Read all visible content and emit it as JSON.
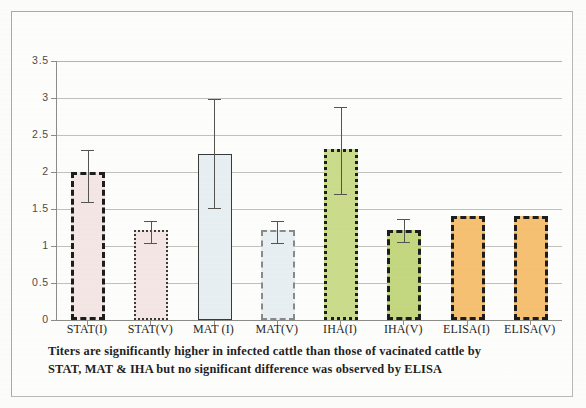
{
  "document": {
    "kind": "scanned-figure",
    "caption_line_1": "Titers are significantly higher in infected cattle than those of vacinated cattle by",
    "caption_line_2": "STAT, MAT & IHA but no significant difference was observed by ELISA"
  },
  "chart_data": {
    "type": "bar",
    "title": "",
    "xlabel": "",
    "ylabel": "",
    "ylim": [
      0,
      3.5
    ],
    "ytick_values": [
      0,
      0.5,
      1,
      1.5,
      2,
      2.5,
      3,
      3.5
    ],
    "ytick_labels": [
      "0",
      "0.5",
      "1",
      "1.5",
      "2",
      "2.5",
      "3",
      "3.5"
    ],
    "grid": true,
    "legend": "none",
    "categories": [
      "STAT(I)",
      "STAT(V)",
      "MAT (I)",
      "MAT(V)",
      "IHA(I)",
      "IHA(V)",
      "ELISA(I)",
      "ELISA(V)"
    ],
    "values": [
      2.0,
      1.21,
      2.25,
      2.31,
      1.21,
      1.21,
      1.4,
      1.4
    ],
    "bars": [
      {
        "label": "STAT(I)",
        "value": 2.0,
        "err_low": 1.6,
        "err_high": 2.3,
        "color": "#f4e7e6",
        "border_style": "dashed",
        "border_color": "#1d1d1d",
        "has_error_bar": true
      },
      {
        "label": "STAT(V)",
        "value": 1.21,
        "err_low": 1.04,
        "err_high": 1.34,
        "color": "#f4e7e6",
        "border_style": "dotted",
        "border_color": "#3a3a3a",
        "has_error_bar": true
      },
      {
        "label": "MAT (I)",
        "value": 2.25,
        "err_low": 1.51,
        "err_high": 2.98,
        "color": "#e9f0f3",
        "border_style": "solid",
        "border_color": "#3a3a3a",
        "has_error_bar": true
      },
      {
        "label": "MAT(V)",
        "value": 1.21,
        "err_low": 1.04,
        "err_high": 1.34,
        "color": "#e9f0f3",
        "border_style": "dashed",
        "border_color": "#8a8a8a",
        "has_error_bar": true
      },
      {
        "label": "IHA(I)",
        "value": 2.31,
        "err_low": 1.7,
        "err_high": 2.88,
        "color": "#cbdd8c",
        "border_style": "dotted",
        "border_color": "#1d1d1d",
        "has_error_bar": true
      },
      {
        "label": "IHA(V)",
        "value": 1.21,
        "err_low": 1.05,
        "err_high": 1.36,
        "color": "#c4d880",
        "border_style": "dashed",
        "border_color": "#1d1d1d",
        "has_error_bar": true
      },
      {
        "label": "ELISA(I)",
        "value": 1.4,
        "err_low": 1.4,
        "err_high": 1.4,
        "color": "#f7c173",
        "border_style": "dashed",
        "border_color": "#1d1d1d",
        "has_error_bar": false
      },
      {
        "label": "ELISA(V)",
        "value": 1.4,
        "err_low": 1.4,
        "err_high": 1.4,
        "color": "#f7c173",
        "border_style": "dashed",
        "border_color": "#1d1d1d",
        "has_error_bar": false
      }
    ]
  }
}
